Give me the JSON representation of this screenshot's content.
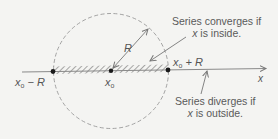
{
  "diagram": {
    "colors": {
      "background": "#f4f4f2",
      "line": "#8a8a8a",
      "circle": "#9a9a9a",
      "dot": "#1a1a1a",
      "hatch": "#7a7a7a",
      "text": "#555555"
    },
    "labels": {
      "left_endpoint": {
        "var": "x",
        "sub": "o",
        "rest": " − R"
      },
      "center": {
        "var": "x",
        "sub": "o"
      },
      "right_endpoint": {
        "var": "x",
        "sub": "o",
        "rest": " + R"
      },
      "radius": "R",
      "axis": "x"
    },
    "notes": {
      "converges_line1": "Series converges if",
      "converges_line2_var": "x",
      "converges_line2_rest": " is inside.",
      "diverges_line1": "Series diverges if",
      "diverges_line2_var": "x",
      "diverges_line2_rest": " is outside."
    }
  }
}
